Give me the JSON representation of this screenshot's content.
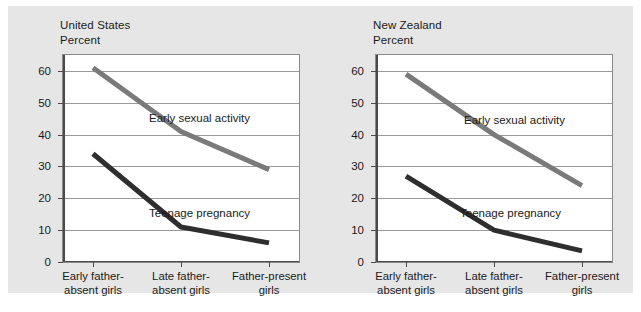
{
  "figure": {
    "background_color": "#e6e6e6",
    "plot_background_color": "#ffffff",
    "gridline_color": "#9a9a9a"
  },
  "charts": [
    {
      "id": "us",
      "title": "United States\nPercent",
      "country": "United States",
      "axis_unit": "Percent"
    },
    {
      "id": "nz",
      "title": "New Zealand\nPercent",
      "country": "New Zealand",
      "axis_unit": "Percent"
    }
  ],
  "chart_data": [
    {
      "type": "line",
      "title": "United States",
      "subtitle": "Percent",
      "xlabel": "",
      "ylabel": "Percent",
      "ylim": [
        0,
        65
      ],
      "yticks": [
        0,
        10,
        20,
        30,
        40,
        50,
        60
      ],
      "ytick_labels": [
        "0",
        "10",
        "20",
        "30",
        "40",
        "50",
        "60"
      ],
      "grid": true,
      "legend": "inline-annotations",
      "categories": [
        "Early father-absent girls",
        "Late father-absent girls",
        "Father-present girls"
      ],
      "series": [
        {
          "name": "Early sexual activity",
          "color": "#7a7a7a",
          "values": [
            61,
            41,
            29
          ],
          "label_position": "above-line"
        },
        {
          "name": "Teenage pregnancy",
          "color": "#2e2e2e",
          "values": [
            34,
            11,
            6
          ],
          "label_position": "above-line"
        }
      ]
    },
    {
      "type": "line",
      "title": "New Zealand",
      "subtitle": "Percent",
      "xlabel": "",
      "ylabel": "Percent",
      "ylim": [
        0,
        65
      ],
      "yticks": [
        0,
        10,
        20,
        30,
        40,
        50,
        60
      ],
      "ytick_labels": [
        "0",
        "10",
        "20",
        "30",
        "40",
        "50",
        "60"
      ],
      "grid": true,
      "legend": "inline-annotations",
      "categories": [
        "Early father-absent girls",
        "Late father-absent girls",
        "Father-present girls"
      ],
      "series": [
        {
          "name": "Early sexual activity",
          "color": "#7a7a7a",
          "values": [
            59,
            40,
            24
          ],
          "label_position": "above-line"
        },
        {
          "name": "Teenage pregnancy",
          "color": "#2e2e2e",
          "values": [
            27,
            10,
            3.5
          ],
          "label_position": "above-line"
        }
      ]
    }
  ],
  "category_labels_wrapped": [
    "Early father-\nabsent girls",
    "Late father-\nabsent girls",
    "Father-present\ngirls"
  ]
}
